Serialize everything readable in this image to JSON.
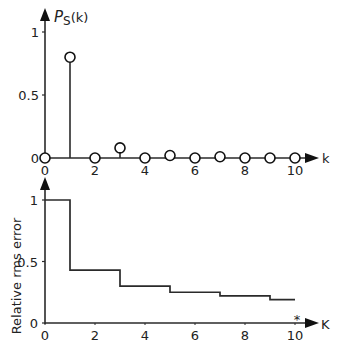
{
  "chart_data": [
    {
      "type": "stem",
      "title": "",
      "ylabel": "P_S(k)",
      "ylabel_main": "P",
      "ylabel_sub": "S",
      "ylabel_suffix": "(k)",
      "xlabel": "k",
      "x": [
        0,
        1,
        2,
        3,
        4,
        5,
        6,
        7,
        8,
        9,
        10
      ],
      "values": [
        0,
        0.8,
        0,
        0.08,
        0,
        0.02,
        0,
        0.01,
        0,
        0,
        0
      ],
      "xticks": [
        "0",
        "2",
        "4",
        "6",
        "8",
        "10"
      ],
      "yticks": [
        "0",
        "0.5",
        "1"
      ],
      "xlim": [
        0,
        10
      ],
      "ylim": [
        0,
        1
      ],
      "grid": false
    },
    {
      "type": "step",
      "title": "",
      "ylabel": "Relative rms error",
      "xlabel": "K",
      "x_marker": "*",
      "steps": [
        {
          "from": 0,
          "to": 1,
          "value": 1.0
        },
        {
          "from": 1,
          "to": 3,
          "value": 0.43
        },
        {
          "from": 3,
          "to": 5,
          "value": 0.3
        },
        {
          "from": 5,
          "to": 7,
          "value": 0.25
        },
        {
          "from": 7,
          "to": 9,
          "value": 0.22
        },
        {
          "from": 9,
          "to": 10,
          "value": 0.19
        }
      ],
      "xticks": [
        "0",
        "2",
        "4",
        "6",
        "8",
        "10"
      ],
      "yticks": [
        "0",
        "0.5",
        "1"
      ],
      "xlim": [
        0,
        10
      ],
      "ylim": [
        0,
        1
      ],
      "grid": false
    }
  ]
}
